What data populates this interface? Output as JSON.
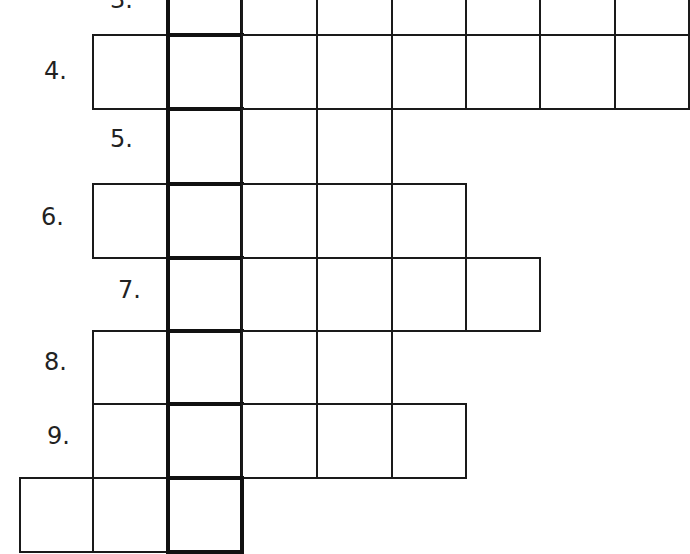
{
  "puzzle": {
    "type": "crossword",
    "cell_size": 74.5,
    "grid_origin_x": 20,
    "column_x": [
      20,
      93,
      168,
      242,
      317,
      392,
      466,
      540,
      615,
      689
    ],
    "row_y": [
      -39,
      35,
      109,
      184,
      258,
      331,
      404,
      478,
      552
    ],
    "key_column_index": 2,
    "rows": [
      {
        "number": "3.",
        "label_x": 110,
        "label_y": -12,
        "start_col": 2,
        "length": 7
      },
      {
        "number": "4.",
        "label_x": 44,
        "label_y": 59,
        "start_col": 1,
        "length": 8
      },
      {
        "number": "5.",
        "label_x": 110,
        "label_y": 127,
        "start_col": 2,
        "length": 3
      },
      {
        "number": "6.",
        "label_x": 41,
        "label_y": 205,
        "start_col": 1,
        "length": 5
      },
      {
        "number": "7.",
        "label_x": 118,
        "label_y": 278,
        "start_col": 2,
        "length": 5
      },
      {
        "number": "8.",
        "label_x": 44,
        "label_y": 350,
        "start_col": 1,
        "length": 4
      },
      {
        "number": "9.",
        "label_x": 47,
        "label_y": 424,
        "start_col": 1,
        "length": 5
      },
      {
        "number": "",
        "label_x": 0,
        "label_y": 0,
        "start_col": 0,
        "length": 3
      }
    ]
  }
}
